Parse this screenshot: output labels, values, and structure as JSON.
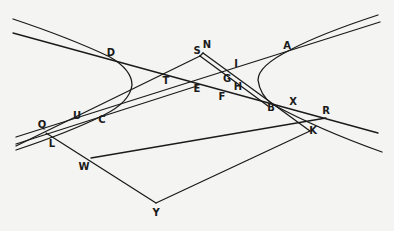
{
  "diagram": {
    "type": "geometric construction",
    "points": [
      {
        "id": "A",
        "label": "A",
        "x": 288,
        "y": 47
      },
      {
        "id": "B",
        "label": "B",
        "x": 272,
        "y": 107
      },
      {
        "id": "C",
        "label": "C",
        "x": 104,
        "y": 119
      },
      {
        "id": "D",
        "label": "D",
        "x": 112,
        "y": 55
      },
      {
        "id": "E",
        "label": "E",
        "x": 197,
        "y": 88
      },
      {
        "id": "F",
        "label": "F",
        "x": 222,
        "y": 97
      },
      {
        "id": "G",
        "label": "G",
        "x": 227,
        "y": 78
      },
      {
        "id": "H",
        "label": "H",
        "x": 238,
        "y": 86
      },
      {
        "id": "I",
        "label": "I",
        "x": 236,
        "y": 64
      },
      {
        "id": "K",
        "label": "K",
        "x": 313,
        "y": 131
      },
      {
        "id": "L",
        "label": "L",
        "x": 52,
        "y": 145
      },
      {
        "id": "N",
        "label": "N",
        "x": 207,
        "y": 45
      },
      {
        "id": "Q",
        "label": "Q",
        "x": 42,
        "y": 125
      },
      {
        "id": "R",
        "label": "R",
        "x": 326,
        "y": 111
      },
      {
        "id": "S",
        "label": "S",
        "x": 197,
        "y": 51
      },
      {
        "id": "T",
        "label": "T",
        "x": 166,
        "y": 80
      },
      {
        "id": "U",
        "label": "U",
        "x": 77,
        "y": 116
      },
      {
        "id": "W",
        "label": "W",
        "x": 84,
        "y": 167
      },
      {
        "id": "X",
        "label": "X",
        "x": 293,
        "y": 102
      },
      {
        "id": "Y",
        "label": "Y",
        "x": 156,
        "y": 212
      }
    ],
    "colors": {
      "background": "#f4f4f2",
      "ink": "#1a1a1a"
    }
  }
}
